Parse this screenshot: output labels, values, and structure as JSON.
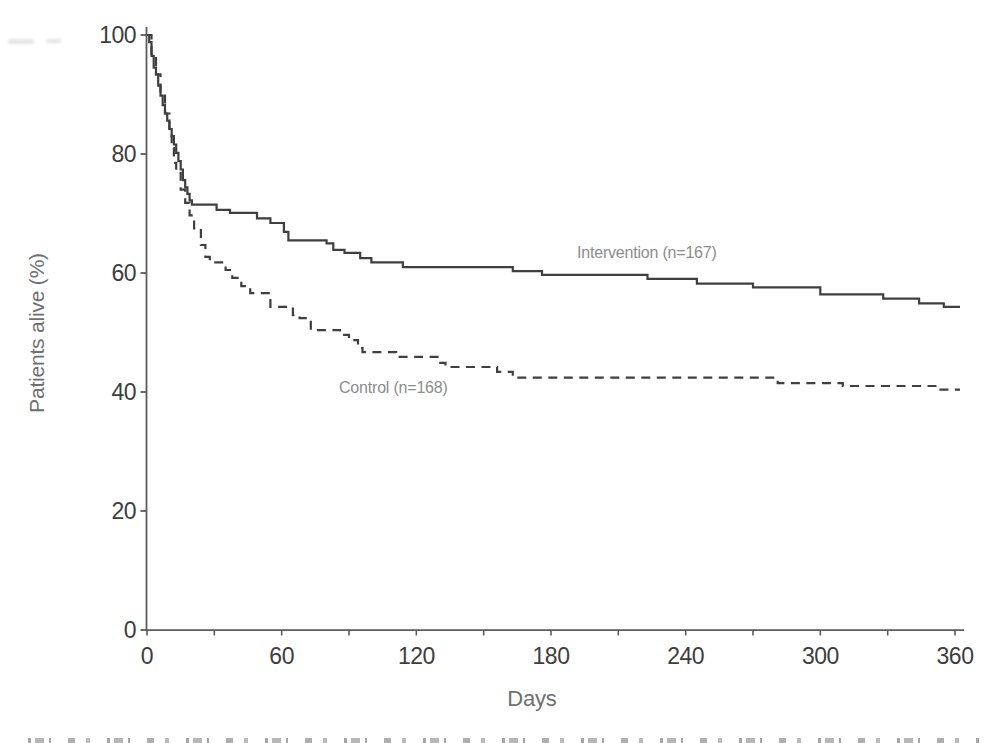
{
  "figure": {
    "y_axis_title": "Patients alive (%)",
    "x_axis_title": "Days",
    "annotations": {
      "intervention_label": "Intervention (n=167)",
      "control_label": "Control (n=168)"
    }
  },
  "colors": {
    "curve": "#3f3f3f",
    "axis": "#5c5c5c",
    "tick_text": "#3d3d3d",
    "axis_title_text": "#6f6f6f",
    "annotation_text": "#8d8d8d",
    "background": "#ffffff"
  },
  "chart_data": {
    "type": "line",
    "subtype": "kaplan_meier_step",
    "title": "",
    "xlabel": "Days",
    "ylabel": "Patients alive (%)",
    "xlim": [
      0,
      360
    ],
    "ylim": [
      0,
      100
    ],
    "x_ticks": [
      0,
      60,
      120,
      180,
      240,
      300,
      360
    ],
    "x_minor_tick_interval": 30,
    "y_ticks": [
      0,
      20,
      40,
      60,
      80,
      100
    ],
    "grid": false,
    "legend_position": "inline annotations near curves",
    "series": [
      {
        "name": "Intervention (n=167)",
        "n": 167,
        "line_style": "solid",
        "color": "#3f3f3f",
        "points_day_percent": [
          [
            0,
            100
          ],
          [
            1,
            98.8
          ],
          [
            2,
            96.5
          ],
          [
            3,
            94.5
          ],
          [
            4,
            93.4
          ],
          [
            5,
            91.5
          ],
          [
            6,
            89.8
          ],
          [
            7,
            88.2
          ],
          [
            8,
            86.8
          ],
          [
            9,
            85.6
          ],
          [
            10,
            84.2
          ],
          [
            11,
            83.0
          ],
          [
            12,
            81.6
          ],
          [
            13,
            80.2
          ],
          [
            14,
            78.8
          ],
          [
            15,
            77.4
          ],
          [
            16,
            75.6
          ],
          [
            17,
            74.4
          ],
          [
            18,
            73.3
          ],
          [
            19,
            72.2
          ],
          [
            20,
            71.5
          ],
          [
            31,
            70.6
          ],
          [
            37,
            70.1
          ],
          [
            49,
            69.2
          ],
          [
            55,
            68.4
          ],
          [
            61,
            66.9
          ],
          [
            63,
            65.5
          ],
          [
            80,
            65.0
          ],
          [
            83,
            63.9
          ],
          [
            88,
            63.4
          ],
          [
            95,
            62.5
          ],
          [
            100,
            61.8
          ],
          [
            114,
            61.0
          ],
          [
            163,
            60.3
          ],
          [
            176,
            59.7
          ],
          [
            223,
            59.0
          ],
          [
            245,
            58.2
          ],
          [
            270,
            57.6
          ],
          [
            300,
            56.4
          ],
          [
            328,
            55.7
          ],
          [
            344,
            54.9
          ],
          [
            355,
            54.3
          ],
          [
            360,
            54.3
          ]
        ]
      },
      {
        "name": "Control (n=168)",
        "n": 168,
        "line_style": "dashed",
        "color": "#3f3f3f",
        "points_day_percent": [
          [
            0,
            100
          ],
          [
            2,
            96.5
          ],
          [
            4,
            93.4
          ],
          [
            6,
            89.8
          ],
          [
            8,
            86.8
          ],
          [
            10,
            84.2
          ],
          [
            11,
            81.0
          ],
          [
            12,
            78.5
          ],
          [
            13,
            76.8
          ],
          [
            15,
            74.0
          ],
          [
            17,
            71.8
          ],
          [
            19,
            69.7
          ],
          [
            21,
            67.2
          ],
          [
            24,
            64.7
          ],
          [
            26,
            62.7
          ],
          [
            28,
            61.8
          ],
          [
            35,
            60.5
          ],
          [
            38,
            59.2
          ],
          [
            42,
            57.8
          ],
          [
            46,
            56.6
          ],
          [
            55,
            54.3
          ],
          [
            65,
            52.9
          ],
          [
            68,
            52.4
          ],
          [
            73,
            50.4
          ],
          [
            86,
            49.6
          ],
          [
            90,
            48.7
          ],
          [
            94,
            47.4
          ],
          [
            96,
            46.7
          ],
          [
            111,
            45.9
          ],
          [
            130,
            44.9
          ],
          [
            133,
            44.2
          ],
          [
            156,
            43.4
          ],
          [
            163,
            42.4
          ],
          [
            281,
            41.5
          ],
          [
            310,
            41.0
          ],
          [
            352,
            40.4
          ],
          [
            360,
            40.4
          ]
        ]
      }
    ]
  }
}
